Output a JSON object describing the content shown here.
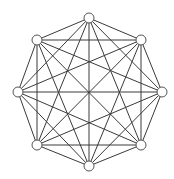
{
  "diagram": {
    "type": "complete-graph",
    "name": "K8",
    "edge_color": "#3a3a3a",
    "node_stroke": "#555555",
    "node_fill": "#ffffff",
    "node_radius": 5,
    "nodes": [
      {
        "id": "n0",
        "x": 89,
        "y": 18
      },
      {
        "id": "n1",
        "x": 141,
        "y": 40
      },
      {
        "id": "n2",
        "x": 162,
        "y": 92
      },
      {
        "id": "n3",
        "x": 141,
        "y": 145
      },
      {
        "id": "n4",
        "x": 89,
        "y": 166
      },
      {
        "id": "n5",
        "x": 37,
        "y": 145
      },
      {
        "id": "n6",
        "x": 18,
        "y": 92
      },
      {
        "id": "n7",
        "x": 37,
        "y": 40
      }
    ]
  }
}
